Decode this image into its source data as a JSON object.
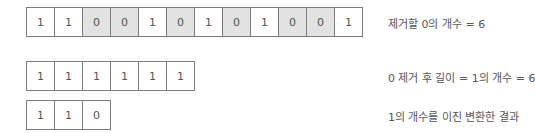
{
  "rows": [
    {
      "cells": [
        "1",
        "1",
        "0",
        "0",
        "1",
        "0",
        "1",
        "0",
        "1",
        "0",
        "0",
        "1"
      ],
      "highlight": [
        false,
        false,
        true,
        true,
        false,
        true,
        false,
        true,
        false,
        true,
        true,
        false
      ],
      "label": "제거할 0의 개수 = 6"
    },
    {
      "cells": [
        "1",
        "1",
        "1",
        "1",
        "1",
        "1"
      ],
      "highlight": [
        false,
        false,
        false,
        false,
        false,
        false
      ],
      "label": "0 제거 후 길이 = 1의 개수 = 6"
    },
    {
      "cells": [
        "1",
        "1",
        "0"
      ],
      "highlight": [
        false,
        false,
        false
      ],
      "label": "1의 개수를 이진 변환한 결과"
    }
  ],
  "colors": {
    "zero_fill": "#e2e2e2",
    "border": "#7a7a7a"
  }
}
